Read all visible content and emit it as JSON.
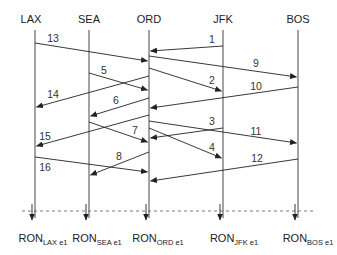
{
  "diagram": {
    "type": "message-sequence",
    "nodes": [
      {
        "id": "LAX",
        "label": "LAX",
        "x": 35
      },
      {
        "id": "SEA",
        "label": "SEA",
        "x": 89
      },
      {
        "id": "ORD",
        "label": "ORD",
        "x": 149
      },
      {
        "id": "JFK",
        "label": "JFK",
        "x": 223
      },
      {
        "id": "BOS",
        "label": "BOS",
        "x": 298
      }
    ],
    "messages": [
      {
        "label": "1",
        "from": "JFK",
        "to": "ORD",
        "y1": 46,
        "y2": 51,
        "lx": 212,
        "ly": 39
      },
      {
        "label": "13",
        "from": "LAX",
        "to": "ORD",
        "y1": 43,
        "y2": 61,
        "lx": 53,
        "ly": 38
      },
      {
        "label": "9",
        "from": "ORD",
        "to": "BOS",
        "y1": 56,
        "y2": 77,
        "lx": 256,
        "ly": 63
      },
      {
        "label": "2",
        "from": "ORD",
        "to": "JFK",
        "y1": 68,
        "y2": 91,
        "lx": 212,
        "ly": 80
      },
      {
        "label": "5",
        "from": "SEA",
        "to": "ORD",
        "y1": 73,
        "y2": 90,
        "lx": 104,
        "ly": 70
      },
      {
        "label": "14",
        "from": "ORD",
        "to": "LAX",
        "y1": 76,
        "y2": 107,
        "lx": 53,
        "ly": 94
      },
      {
        "label": "10",
        "from": "BOS",
        "to": "ORD",
        "y1": 87,
        "y2": 108,
        "lx": 256,
        "ly": 86
      },
      {
        "label": "6",
        "from": "ORD",
        "to": "SEA",
        "y1": 98,
        "y2": 116,
        "lx": 116,
        "ly": 100
      },
      {
        "label": "3",
        "from": "JFK",
        "to": "ORD",
        "y1": 128,
        "y2": 138,
        "lx": 212,
        "ly": 121
      },
      {
        "label": "7",
        "from": "SEA",
        "to": "ORD",
        "y1": 122,
        "y2": 142,
        "lx": 135,
        "ly": 130
      },
      {
        "label": "15",
        "from": "ORD",
        "to": "LAX",
        "y1": 115,
        "y2": 146,
        "lx": 45,
        "ly": 136
      },
      {
        "label": "11",
        "from": "ORD",
        "to": "BOS",
        "y1": 121,
        "y2": 143,
        "lx": 256,
        "ly": 131
      },
      {
        "label": "4",
        "from": "ORD",
        "to": "JFK",
        "y1": 128,
        "y2": 158,
        "lx": 212,
        "ly": 147
      },
      {
        "label": "8",
        "from": "ORD",
        "to": "SEA",
        "y1": 152,
        "y2": 175,
        "lx": 119,
        "ly": 156
      },
      {
        "label": "16",
        "from": "LAX",
        "to": "ORD",
        "y1": 157,
        "y2": 172,
        "lx": 45,
        "ly": 167
      },
      {
        "label": "12",
        "from": "BOS",
        "to": "ORD",
        "y1": 159,
        "y2": 181,
        "lx": 257,
        "ly": 158
      }
    ],
    "cut_line_y": 211,
    "snapshots": [
      {
        "main": "RON",
        "sub": "LAX e1",
        "node": "LAX"
      },
      {
        "main": "RON",
        "sub": "SEA e1",
        "node": "SEA"
      },
      {
        "main": "RON",
        "sub": "ORD e1",
        "node": "ORD"
      },
      {
        "main": "RON",
        "sub": "JFK e1",
        "node": "JFK"
      },
      {
        "main": "RON",
        "sub": "BOS e1",
        "node": "BOS"
      }
    ]
  }
}
